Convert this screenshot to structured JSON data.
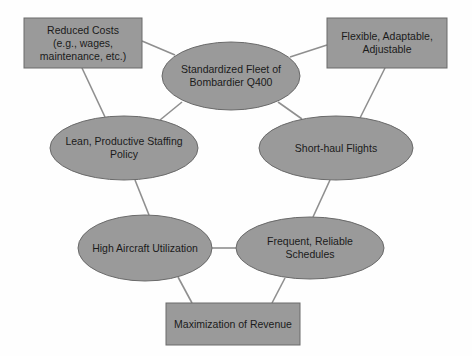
{
  "diagram": {
    "colors": {
      "fill": "#9a9a9a",
      "stroke": "#6a6a6a",
      "edge": "#8f8f8f",
      "text": "#1a1a1a"
    },
    "nodes": [
      {
        "id": "reduced-costs",
        "shape": "rect",
        "label": "Reduced Costs\n(e.g., wages,\nmaintenance, etc.)",
        "x": 24,
        "y": 18,
        "w": 118,
        "h": 50
      },
      {
        "id": "flexible",
        "shape": "rect",
        "label": "Flexible, Adaptable,\nAdjustable",
        "x": 327,
        "y": 18,
        "w": 120,
        "h": 50
      },
      {
        "id": "standardized-fleet",
        "shape": "ellipse",
        "label": "Standardized Fleet of\nBombardier Q400",
        "cx": 231,
        "cy": 76,
        "rx": 69,
        "ry": 34
      },
      {
        "id": "lean-staffing",
        "shape": "ellipse",
        "label": "Lean, Productive Staffing\nPolicy",
        "cx": 124,
        "cy": 148,
        "rx": 74,
        "ry": 32
      },
      {
        "id": "short-haul",
        "shape": "ellipse",
        "label": "Short-haul Flights",
        "cx": 336,
        "cy": 148,
        "rx": 77,
        "ry": 32
      },
      {
        "id": "high-utilization",
        "shape": "ellipse",
        "label": "High Aircraft Utilization",
        "cx": 145,
        "cy": 248,
        "rx": 67,
        "ry": 33
      },
      {
        "id": "frequent-schedules",
        "shape": "ellipse",
        "label": "Frequent, Reliable\nSchedules",
        "cx": 310,
        "cy": 248,
        "rx": 74,
        "ry": 31
      },
      {
        "id": "max-revenue",
        "shape": "rect",
        "label": "Maximization of Revenue",
        "x": 166,
        "y": 303,
        "w": 134,
        "h": 42
      }
    ],
    "edges": [
      {
        "from": "reduced-costs",
        "to": "standardized-fleet",
        "x1": 142,
        "y1": 41,
        "x2": 175,
        "y2": 55
      },
      {
        "from": "reduced-costs",
        "to": "lean-staffing",
        "x1": 82,
        "y1": 68,
        "x2": 105,
        "y2": 117
      },
      {
        "from": "standardized-fleet",
        "to": "lean-staffing",
        "x1": 182,
        "y1": 102,
        "x2": 160,
        "y2": 120
      },
      {
        "from": "standardized-fleet",
        "to": "flexible",
        "x1": 290,
        "y1": 57,
        "x2": 327,
        "y2": 45
      },
      {
        "from": "standardized-fleet",
        "to": "short-haul",
        "x1": 278,
        "y1": 102,
        "x2": 302,
        "y2": 119
      },
      {
        "from": "flexible",
        "to": "short-haul",
        "x1": 385,
        "y1": 68,
        "x2": 360,
        "y2": 118
      },
      {
        "from": "lean-staffing",
        "to": "high-utilization",
        "x1": 135,
        "y1": 180,
        "x2": 149,
        "y2": 215
      },
      {
        "from": "short-haul",
        "to": "frequent-schedules",
        "x1": 330,
        "y1": 180,
        "x2": 313,
        "y2": 217
      },
      {
        "from": "high-utilization",
        "to": "frequent-schedules",
        "x1": 212,
        "y1": 248,
        "x2": 237,
        "y2": 248
      },
      {
        "from": "high-utilization",
        "to": "max-revenue",
        "x1": 178,
        "y1": 277,
        "x2": 192,
        "y2": 303
      },
      {
        "from": "frequent-schedules",
        "to": "max-revenue",
        "x1": 285,
        "y1": 278,
        "x2": 272,
        "y2": 303
      }
    ]
  }
}
